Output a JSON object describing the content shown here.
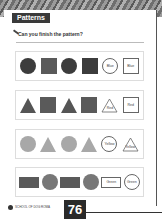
{
  "header": {
    "title": "Patterns"
  },
  "instruction": {
    "text": "Can you finish the pattern?"
  },
  "rows": [
    {
      "shapes": [
        "circle-dark",
        "square-dark",
        "circle-dark",
        "square-dark"
      ],
      "answers": [
        "Blue",
        "Blue"
      ]
    },
    {
      "shapes": [
        "triangle-mid",
        "square-mid",
        "triangle-mid",
        "square-mid"
      ],
      "answers": [
        "Red",
        "Red"
      ]
    },
    {
      "shapes": [
        "circle-light",
        "triangle-light",
        "circle-light",
        "triangle-light"
      ],
      "answers": [
        "Yellow",
        "Yellow"
      ]
    },
    {
      "shapes": [
        "rect-mid",
        "circle-mid",
        "rect-mid",
        "circle-mid"
      ],
      "answers": [
        "Green",
        "Green"
      ]
    }
  ],
  "footer": {
    "publisher": "SCHOOL OF DOG ROMA",
    "page_number": "76"
  }
}
